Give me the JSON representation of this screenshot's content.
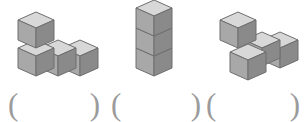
{
  "page": {
    "background_color": "#ffffff",
    "width": 306,
    "height": 122
  },
  "style": {
    "cube_top_color": "#d8d8d8",
    "cube_front_color": "#a8a8a8",
    "cube_side_color": "#8a8a8a",
    "cube_outline_color": "#6e6e6e",
    "paren_color": "#9b9b9b"
  },
  "figures": [
    {
      "id": "figure-1",
      "name": "l-shape-four-cubes",
      "cube_count": 4,
      "description": "Three cubes in a row with one cube stacked on the leftmost cube"
    },
    {
      "id": "figure-2",
      "name": "vertical-tower-three-cubes",
      "cube_count": 3,
      "description": "Three cubes stacked vertically in a single column"
    },
    {
      "id": "figure-3",
      "name": "stepped-shape-four-cubes",
      "cube_count": 4,
      "description": "One raised cube at back left with three cubes forming an L below and to the right"
    }
  ],
  "answers": [
    {
      "id": "answer-1",
      "open_paren": "(",
      "close_paren": ")",
      "value": ""
    },
    {
      "id": "answer-2",
      "open_paren": "(",
      "close_paren": ")",
      "value": ""
    },
    {
      "id": "answer-3",
      "open_paren": "(",
      "close_paren": ")",
      "value": ""
    }
  ]
}
